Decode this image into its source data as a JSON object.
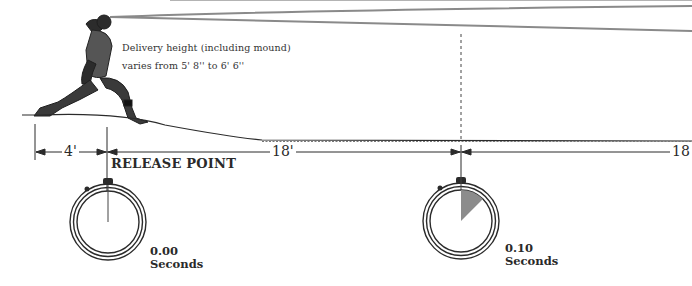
{
  "diagram": {
    "title_caption": {
      "line1": "Delivery height (including mound)",
      "line2": "varies from 5' 8''  to  6' 6''"
    },
    "release_point_label": "RELEASE POINT",
    "distances": [
      {
        "label": "4'",
        "from_x": 35,
        "to_x": 107
      },
      {
        "label": "18'",
        "from_x": 107,
        "to_x": 462
      },
      {
        "label": "18",
        "from_x": 462,
        "to_x": 692
      }
    ],
    "stopwatches": [
      {
        "value": "0.00",
        "unit": "Seconds",
        "elapsed_fraction": 0.0
      },
      {
        "value": "0.10",
        "unit": "Seconds",
        "elapsed_fraction": 0.125
      }
    ],
    "colors": {
      "ink": "#2a2a2a",
      "trajectory": "#8a8a8a",
      "sweep_fill": "#8c8c8c",
      "background": "#ffffff"
    },
    "icons": {
      "pitcher": "pitcher-illustration",
      "stopwatch": "stopwatch-icon"
    }
  }
}
